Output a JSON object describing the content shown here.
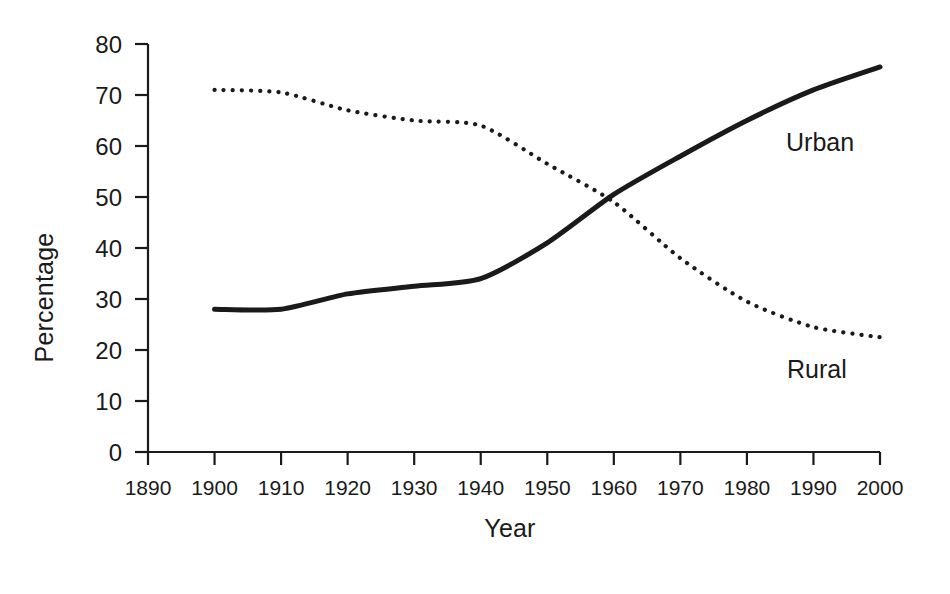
{
  "chart_data": {
    "type": "line",
    "title": "",
    "subtitle": "",
    "xlabel": "Year",
    "ylabel": "Percentage",
    "x": [
      1900,
      1910,
      1920,
      1930,
      1940,
      1950,
      1960,
      1970,
      1980,
      1990,
      2000
    ],
    "xlim": [
      1890,
      2000
    ],
    "ylim": [
      0,
      80
    ],
    "grid": false,
    "legend_position": "inline-right",
    "xticks": [
      "1890",
      "1900",
      "1910",
      "1920",
      "1930",
      "1940",
      "1950",
      "1960",
      "1970",
      "1980",
      "1990",
      "2000"
    ],
    "xtick_values": [
      1890,
      1900,
      1910,
      1920,
      1930,
      1940,
      1950,
      1960,
      1970,
      1980,
      1990,
      2000
    ],
    "yticks": [
      "0",
      "10",
      "20",
      "30",
      "40",
      "50",
      "60",
      "70",
      "80"
    ],
    "ytick_values": [
      0,
      10,
      20,
      30,
      40,
      50,
      60,
      70,
      80
    ],
    "series": [
      {
        "name": "Urban",
        "style": "solid",
        "color": "#1a1a1a",
        "values": [
          28,
          28,
          31,
          32.5,
          34,
          41,
          50.5,
          58,
          65,
          71,
          75.5
        ]
      },
      {
        "name": "Rural",
        "style": "dotted",
        "color": "#1a1a1a",
        "values": [
          71,
          70.5,
          67,
          65,
          64,
          56.5,
          49,
          38,
          29.5,
          24.5,
          22.5
        ]
      }
    ],
    "annotations": [
      {
        "text": "Urban",
        "x": 1985,
        "y": 60
      },
      {
        "text": "Rural",
        "x": 1985,
        "y": 19
      }
    ]
  },
  "labels": {
    "y_axis_title": "Percentage",
    "x_axis_title": "Year",
    "series_urban": "Urban",
    "series_rural": "Rural"
  },
  "colors": {
    "ink": "#1a1a1a",
    "background": "#ffffff"
  }
}
